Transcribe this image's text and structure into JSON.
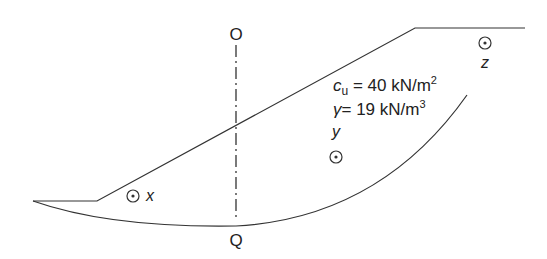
{
  "diagram": {
    "type": "slope-stability-circular-slip",
    "labels": {
      "top_point": "O",
      "bottom_point": "Q",
      "point_x": "x",
      "point_y": "y",
      "point_z": "z"
    },
    "soil_properties": {
      "cu_symbol": "c",
      "cu_subscript": "u",
      "cu_value": " = 40 kN/m",
      "cu_exp": "2",
      "gamma_symbol": "γ",
      "gamma_value": "= 19 kN/m",
      "gamma_exp": "3"
    },
    "colors": {
      "line": "#333333",
      "text": "#222222"
    }
  }
}
